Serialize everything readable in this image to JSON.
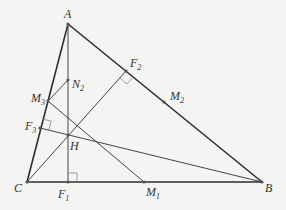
{
  "diagram": {
    "colors": {
      "background": "#f4f4f2",
      "line": "#2e2e2e",
      "thin": "#444444",
      "right_angle": "#888888"
    },
    "points": {
      "A": {
        "x": 68,
        "y": 24,
        "label": "A",
        "sub": ""
      },
      "B": {
        "x": 262,
        "y": 182,
        "label": "B",
        "sub": ""
      },
      "C": {
        "x": 27,
        "y": 182,
        "label": "C",
        "sub": ""
      },
      "F1": {
        "x": 68,
        "y": 182,
        "label": "F",
        "sub": "1"
      },
      "F2": {
        "x": 126,
        "y": 71,
        "label": "F",
        "sub": "2"
      },
      "F3": {
        "x": 40,
        "y": 128,
        "label": "F",
        "sub": "3"
      },
      "M1": {
        "x": 144,
        "y": 182,
        "label": "M",
        "sub": "1"
      },
      "M2": {
        "x": 164,
        "y": 102,
        "label": "M",
        "sub": "2"
      },
      "M3": {
        "x": 48,
        "y": 101,
        "label": "M",
        "sub": "3"
      },
      "N2": {
        "x": 68,
        "y": 80,
        "label": "N",
        "sub": "2"
      },
      "H": {
        "x": 68,
        "y": 135,
        "label": "H",
        "sub": ""
      }
    }
  }
}
